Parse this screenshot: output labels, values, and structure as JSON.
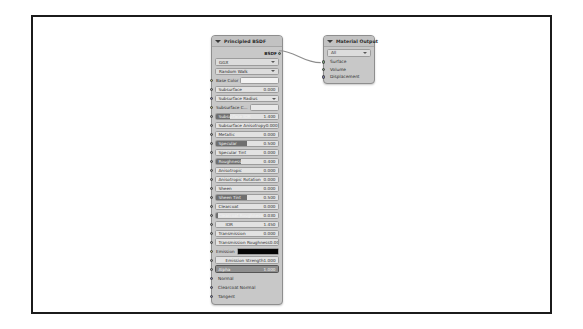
{
  "editor": {
    "name": "blender-shader-node-editor",
    "background_color": "#ffffff",
    "frame_border_color": "#1b1b1b"
  },
  "nodes": {
    "principled": {
      "title": "Principled BSDF",
      "collapse_icon": "chevron-down-icon",
      "outputs": [
        {
          "label": "BSDF",
          "socket_type": "shader",
          "socket_color": "#7a9f7a"
        }
      ],
      "dropdowns": [
        {
          "name": "distribution",
          "value": "GGX"
        },
        {
          "name": "subsurface-method",
          "value": "Random Walk"
        }
      ],
      "properties": [
        {
          "label": "Base Color",
          "kind": "color",
          "swatch": "#f2f2f2",
          "socket": "color"
        },
        {
          "label": "Subsurface",
          "kind": "slider",
          "value": "0.000",
          "fill": 0,
          "socket": "value"
        },
        {
          "label": "Subsurface Radius",
          "kind": "menu",
          "value": "",
          "socket": "vector"
        },
        {
          "label": "Subsurface C...",
          "kind": "color",
          "swatch": "#e8e8e8",
          "socket": "color"
        },
        {
          "label": "Subsurface IOR",
          "kind": "slider",
          "value": "1.400",
          "fill": 22,
          "socket": "value"
        },
        {
          "label": "Subsurface Anisotropy",
          "kind": "slider",
          "value": "0.000",
          "fill": 0,
          "socket": "value"
        },
        {
          "label": "Metallic",
          "kind": "slider",
          "value": "0.000",
          "fill": 0,
          "socket": "value"
        },
        {
          "label": "Specular",
          "kind": "slider",
          "value": "0.500",
          "fill": 50,
          "socket": "value"
        },
        {
          "label": "Specular Tint",
          "kind": "slider",
          "value": "0.000",
          "fill": 0,
          "socket": "value"
        },
        {
          "label": "Roughness",
          "kind": "slider",
          "value": "0.400",
          "fill": 40,
          "socket": "value"
        },
        {
          "label": "Anisotropic",
          "kind": "slider",
          "value": "0.000",
          "fill": 0,
          "socket": "value"
        },
        {
          "label": "Anisotropic Rotation",
          "kind": "slider",
          "value": "0.000",
          "fill": 0,
          "socket": "value"
        },
        {
          "label": "Sheen",
          "kind": "slider",
          "value": "0.000",
          "fill": 0,
          "socket": "value"
        },
        {
          "label": "Sheen Tint",
          "kind": "slider",
          "value": "0.500",
          "fill": 50,
          "socket": "value"
        },
        {
          "label": "Clearcoat",
          "kind": "slider",
          "value": "0.000",
          "fill": 0,
          "socket": "value"
        },
        {
          "label": "Clearcoat Roughness",
          "kind": "slider",
          "value": "0.030",
          "fill": 3,
          "socket": "value"
        },
        {
          "label": "IOR",
          "kind": "slider",
          "value": "1.450",
          "fill": 0,
          "socket": "value",
          "centered": true
        },
        {
          "label": "Transmission",
          "kind": "slider",
          "value": "0.000",
          "fill": 0,
          "socket": "value"
        },
        {
          "label": "Transmission Roughness",
          "kind": "slider",
          "value": "0.000",
          "fill": 0,
          "socket": "value"
        },
        {
          "label": "Emission",
          "kind": "color",
          "swatch": "#050505",
          "socket": "color"
        },
        {
          "label": "Emission Strength",
          "kind": "slider",
          "value": "1.000",
          "fill": 0,
          "socket": "value",
          "centered": true
        },
        {
          "label": "Alpha",
          "kind": "slider",
          "value": "1.000",
          "fill": 100,
          "socket": "value",
          "selected": true
        },
        {
          "label": "Normal",
          "kind": "socket",
          "socket": "vector"
        },
        {
          "label": "Clearcoat Normal",
          "kind": "socket",
          "socket": "vector"
        },
        {
          "label": "Tangent",
          "kind": "socket",
          "socket": "vector"
        }
      ]
    },
    "material_output": {
      "title": "Material Output",
      "collapse_icon": "chevron-down-icon",
      "dropdowns": [
        {
          "name": "target",
          "value": "All"
        }
      ],
      "inputs": [
        {
          "label": "Surface",
          "socket_type": "shader",
          "socket_color": "#7a9f7a"
        },
        {
          "label": "Volume",
          "socket_type": "shader",
          "socket_color": "#7a9f7a"
        },
        {
          "label": "Displacement",
          "socket_type": "vector",
          "socket_color": "#7f7fa8"
        }
      ]
    }
  },
  "connection": {
    "from": "Principled BSDF / BSDF",
    "to": "Material Output / Surface"
  }
}
